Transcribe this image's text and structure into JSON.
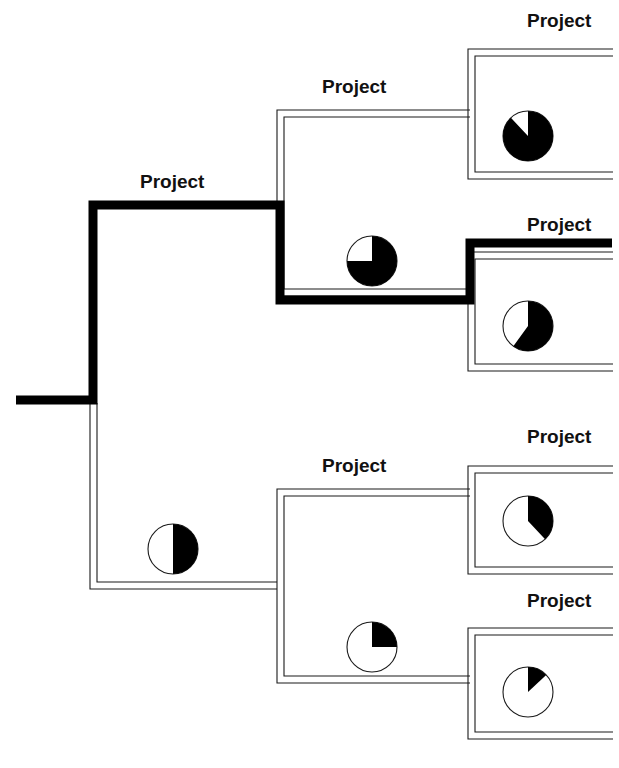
{
  "figure": {
    "caption_fragment": "",
    "background_color": "#ffffff",
    "line_color": "#1a1a1a",
    "highlight_color": "#000000",
    "pie_fill_color": "#000000",
    "pie_empty_color": "#ffffff"
  },
  "labels": {
    "node_label": "Project"
  },
  "nodes": [
    {
      "id": "root-project",
      "label": "Project",
      "label_x": 140,
      "label_y": 188,
      "level": 1,
      "highlighted": true,
      "pie_percent": null
    },
    {
      "id": "upper-branch-project",
      "label": "Project",
      "label_x": 322,
      "label_y": 93,
      "level": 2,
      "highlighted": false,
      "pie_percent": 75,
      "pie_cx": 372,
      "pie_cy": 261,
      "pie_r": 25
    },
    {
      "id": "upper-leaf-a-project",
      "label": "Project",
      "label_x": 527,
      "label_y": 27,
      "level": 3,
      "highlighted": false,
      "pie_percent": 88,
      "pie_cx": 528,
      "pie_cy": 136,
      "pie_r": 25
    },
    {
      "id": "upper-leaf-b-project",
      "label": "Project",
      "label_x": 527,
      "label_y": 231,
      "level": 3,
      "highlighted": true,
      "pie_percent": 60,
      "pie_cx": 528,
      "pie_cy": 326,
      "pie_r": 25
    },
    {
      "id": "lower-branch-project",
      "label": "Project",
      "label_x": 322,
      "label_y": 472,
      "level": 2,
      "highlighted": false,
      "pie_percent": 50,
      "pie_cx": 173,
      "pie_cy": 549,
      "pie_r": 25
    },
    {
      "id": "lower-leaf-a-project",
      "label": "Project",
      "label_x": 527,
      "label_y": 443,
      "level": 3,
      "highlighted": false,
      "pie_percent": 38,
      "pie_cx": 528,
      "pie_cy": 521,
      "pie_r": 25
    },
    {
      "id": "lower-leaf-b-project",
      "label": "Project",
      "label_x": 527,
      "label_y": 607,
      "level": 3,
      "highlighted": false,
      "pie_percent": 13,
      "pie_cx": 528,
      "pie_cy": 692,
      "pie_r": 25
    }
  ],
  "extra_pies": [
    {
      "id": "lower-branch-inner-pie",
      "pie_percent": 25,
      "pie_cx": 372,
      "pie_cy": 647,
      "pie_r": 25
    }
  ],
  "chart_data": {
    "type": "pie",
    "unit": "percent complete",
    "pies": [
      {
        "node": "upper-leaf-a-project",
        "value": 88,
        "position": "top-right leaf"
      },
      {
        "node": "upper-branch-project",
        "value": 75,
        "position": "upper branch body"
      },
      {
        "node": "upper-leaf-b-project",
        "value": 60,
        "position": "second-from-top right leaf"
      },
      {
        "node": "root-project",
        "value": 50,
        "position": "root body"
      },
      {
        "node": "lower-leaf-a-project",
        "value": 38,
        "position": "third-from-top right leaf"
      },
      {
        "node": "lower-branch-project",
        "value": 25,
        "position": "lower branch body"
      },
      {
        "node": "lower-leaf-b-project",
        "value": 13,
        "position": "bottom-right leaf"
      }
    ],
    "fill_start_angle_deg": 0,
    "fill_direction": "clockwise",
    "filled_color": "#000000",
    "empty_color": "#ffffff",
    "legend": []
  },
  "paths": {
    "thin_brackets": [
      "M 275 86 L 275 291 M 281 93 L 281 285",
      "M 470 30 L 470 349 M 476 38 L 476 342",
      "M 275 465 L 275 713 M 281 472 L 281 707",
      "M 470 447 L 470 733 M 476 454 L 476 726"
    ],
    "highlighted_route": "M 16 400 L 93 400 L 93 205 L 280 205 L 280 300 L 470 300 L 470 243 L 610 243"
  }
}
